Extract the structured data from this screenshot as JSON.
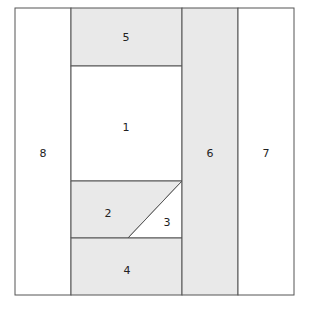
{
  "diagram": {
    "type": "area-partition",
    "colors": {
      "shaded_fill": "#e9e9e9",
      "white_fill": "#ffffff",
      "stroke": "#555555",
      "label": "#222222"
    },
    "outer_box": {
      "x1": 15,
      "y1": 8,
      "x2": 294,
      "y2": 295
    },
    "regions": [
      {
        "id": "1",
        "label": "1",
        "shaded": false,
        "label_pos": [
          126,
          127
        ]
      },
      {
        "id": "2",
        "label": "2",
        "shaded": true,
        "label_pos": [
          108,
          213
        ]
      },
      {
        "id": "3",
        "label": "3",
        "shaded": false,
        "label_pos": [
          167,
          222
        ]
      },
      {
        "id": "4",
        "label": "4",
        "shaded": true,
        "label_pos": [
          127,
          270
        ]
      },
      {
        "id": "5",
        "label": "5",
        "shaded": true,
        "label_pos": [
          126,
          40
        ]
      },
      {
        "id": "6",
        "label": "6",
        "shaded": true,
        "label_pos": [
          210,
          156
        ]
      },
      {
        "id": "7",
        "label": "7",
        "shaded": false,
        "label_pos": [
          266,
          156
        ]
      },
      {
        "id": "8",
        "label": "8",
        "shaded": false,
        "label_pos": [
          43,
          156
        ]
      }
    ]
  }
}
